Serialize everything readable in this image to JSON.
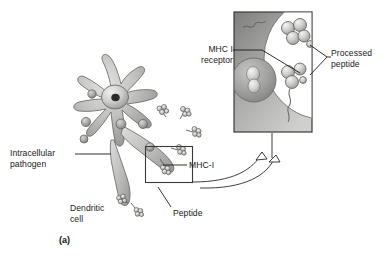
{
  "figure": {
    "panel_letter": "(a)",
    "background_color": "#ffffff",
    "ink_color": "#1a1a1a",
    "labels": {
      "intracellular_pathogen": "Intracellular\npathogen",
      "dendritic_cell": "Dendritic\ncell",
      "peptide": "Peptide",
      "mhc_i": "MHC-I",
      "mhc_i_receptor": "MHC I\nreceptor",
      "processed_peptide": "Processed\npeptide"
    },
    "palette": {
      "cell_body_light": "#d8d8d6",
      "cell_body_mid": "#b3b3b1",
      "cell_body_dark": "#8d8d8b",
      "outline": "#5a5a58",
      "inset_cytoplasm_dark": "#8f8f8d",
      "inset_cytoplasm_light": "#c9c9c7",
      "inset_border": "#4a4a48",
      "vesicle_fill": "#a7a7a5",
      "sphere_light": "#e3e3e1",
      "sphere_mid": "#b8b8b6",
      "leader_line": "#1a1a1a"
    },
    "elements": {
      "dendritic_cell_arms": 8,
      "nucleus": "nucleus-with-nucleolus",
      "intracellular_pathogens_visible": 6,
      "surface_mhc_clusters": 7,
      "callout_box": "rectangle-around-dendrite-tip",
      "magnifier_arrow": "curved-double-line-arrow",
      "inset_panel": "magnified-membrane-view",
      "inset_vesicle_pathogen": "dividing-bacterium",
      "inset_processed_peptide_clusters": 2
    }
  }
}
